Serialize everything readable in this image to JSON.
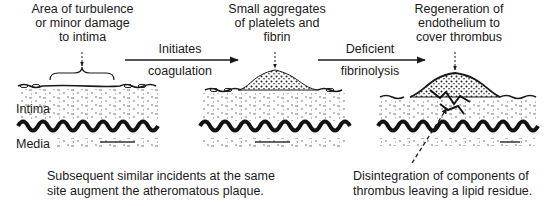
{
  "diagram": {
    "stages": [
      {
        "id": "stage-1",
        "label_lines": [
          "Area of turbulence",
          "or minor damage",
          "to intima"
        ]
      },
      {
        "id": "stage-2",
        "label_lines": [
          "Small aggregates",
          "of platelets and",
          "fibrin"
        ]
      },
      {
        "id": "stage-3",
        "label_lines": [
          "Regeneration of",
          "endothelium to",
          "cover thrombus"
        ]
      }
    ],
    "arrows": [
      {
        "id": "arrow-1",
        "above": "Initiates",
        "below": "coagulation"
      },
      {
        "id": "arrow-2",
        "above": "Deficient",
        "below": "fibrinolysis"
      }
    ],
    "layer_labels": {
      "intima": "Intima",
      "media": "Media"
    },
    "captions": {
      "left": [
        "Subsequent similar incidents at the same",
        "site augment the atheromatous plaque."
      ],
      "right": [
        "Disintegration of components of",
        "thrombus leaving a lipid residue."
      ]
    },
    "colors": {
      "ink": "#1a1a1a",
      "background": "#ffffff"
    }
  }
}
